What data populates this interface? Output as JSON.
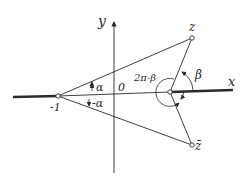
{
  "diagram": {
    "type": "complex-plane-geometry",
    "axes": {
      "x_label": "x",
      "y_label": "y",
      "origin_label": "0"
    },
    "points": [
      {
        "id": "minus-one",
        "label": "-1"
      },
      {
        "id": "z",
        "label": "z"
      },
      {
        "id": "z-bar",
        "label": "z̄"
      },
      {
        "id": "vertex",
        "label": ""
      }
    ],
    "angles": [
      {
        "id": "alpha",
        "label": "α"
      },
      {
        "id": "minus-alpha",
        "label": "-α"
      },
      {
        "id": "beta",
        "label": "β"
      },
      {
        "id": "two-pi-minus-beta",
        "label": "2π-β"
      }
    ],
    "colors": {
      "ink": "#2a2a2a",
      "background": "#ffffff"
    }
  }
}
